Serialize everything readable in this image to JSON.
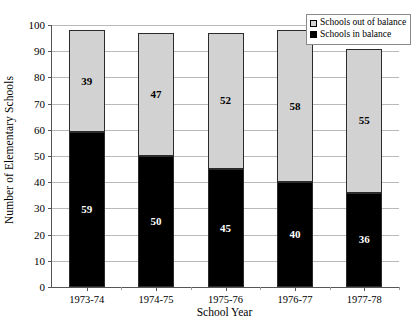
{
  "chart_data": {
    "type": "bar",
    "subtype": "stacked-column",
    "title": "",
    "xlabel": "School Year",
    "ylabel": "Number of Elementary Schools",
    "ylim": [
      0,
      100
    ],
    "ytick_step": 10,
    "yticks": [
      0,
      10,
      20,
      30,
      40,
      50,
      60,
      70,
      80,
      90,
      100
    ],
    "grid": true,
    "grid_axis": "y",
    "legend_position": "top-right",
    "categories": [
      "1973-74",
      "1974-75",
      "1975-76",
      "1976-77",
      "1977-78"
    ],
    "series": [
      {
        "name": "Schools in balance",
        "color": "#000000",
        "stack_position": "bottom",
        "values": [
          59,
          50,
          45,
          40,
          36
        ],
        "labels": [
          "59",
          "50",
          "45",
          "40",
          "36"
        ]
      },
      {
        "name": "Schools out of balance",
        "color": "#d2d2d2",
        "stack_position": "top",
        "values": [
          39,
          47,
          52,
          58,
          55
        ],
        "labels": [
          "39",
          "47",
          "52",
          "58",
          "55"
        ]
      }
    ],
    "totals": [
      98,
      97,
      97,
      98,
      91
    ]
  },
  "legend": {
    "items": [
      {
        "label": "Schools out of balance",
        "swatch": "gray"
      },
      {
        "label": "Schools in balance",
        "swatch": "black"
      }
    ]
  }
}
